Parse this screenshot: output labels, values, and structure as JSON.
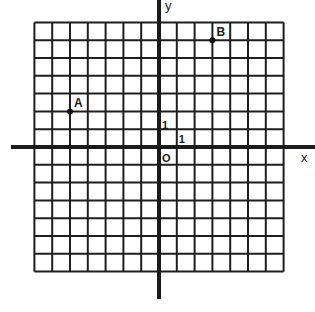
{
  "diagram": {
    "type": "coordinate-grid",
    "grid": {
      "x_min": -7,
      "x_max": 7,
      "y_min": -7,
      "y_max": 7,
      "unit_px": 17.8
    },
    "origin_px": {
      "x": 159,
      "y": 147
    },
    "axes": {
      "x_label": "x",
      "y_label": "y",
      "origin_label": "O",
      "x_unit_label": "1",
      "y_unit_label": "1"
    },
    "points": [
      {
        "label": "A",
        "x": -5,
        "y": 2
      },
      {
        "label": "B",
        "x": 3,
        "y": 6
      }
    ],
    "colors": {
      "line": "#1e1e1e",
      "axis": "#1a1a1a",
      "background": "#ffffff"
    }
  }
}
